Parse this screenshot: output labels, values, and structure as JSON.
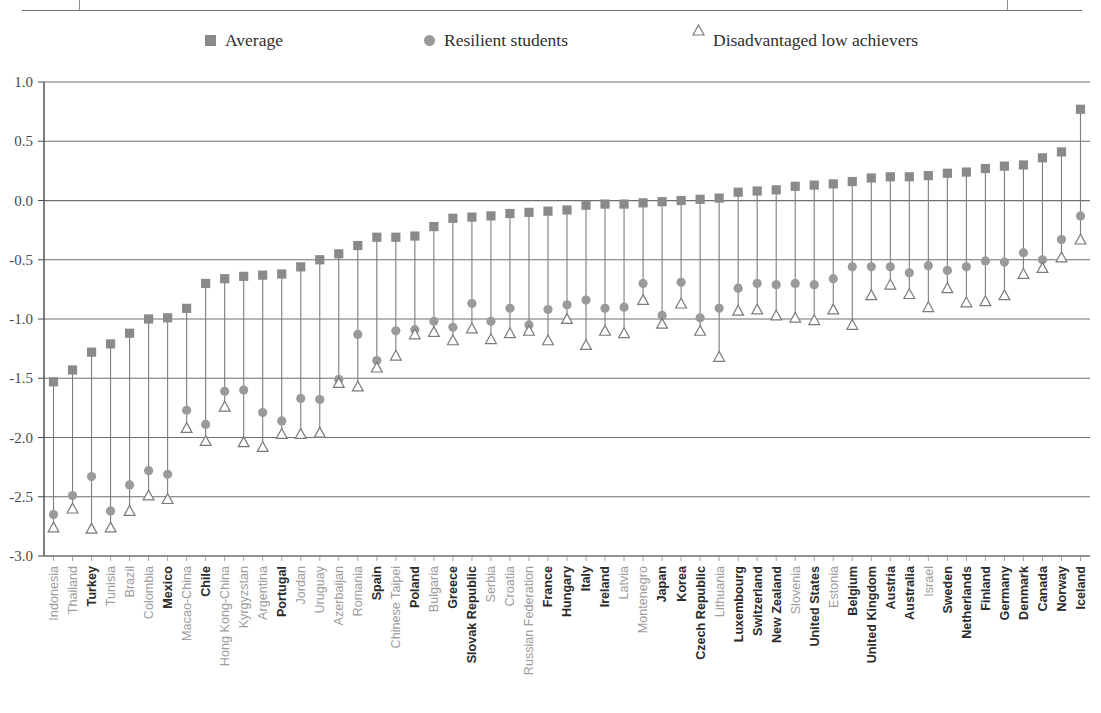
{
  "legend": {
    "items": [
      {
        "label": "Average",
        "marker": "square-marker-icon",
        "color": "#8a8a8a"
      },
      {
        "label": "Resilient students",
        "marker": "circle-marker-icon",
        "color": "#9a9a9a"
      },
      {
        "label": "Disadvantaged low achievers",
        "marker": "triangle-marker-icon",
        "color": "#7a7a7a"
      }
    ]
  },
  "colors": {
    "average": "#8a8a8a",
    "resilient": "#9a9a9a",
    "disadvantaged": "#7a7a7a",
    "gridline": "#6f6f6f",
    "axis": "#4a4a4a",
    "oecd_label": "#2b2b2b",
    "partner_label": "#9d9d9d"
  },
  "chart_data": {
    "type": "scatter",
    "title": "",
    "xlabel": "",
    "ylabel": "",
    "ylim": [
      -3.0,
      1.0
    ],
    "yticks": [
      1.0,
      0.5,
      0.0,
      -0.5,
      -1.0,
      -1.5,
      -2.0,
      -2.5,
      -3.0
    ],
    "ytick_labels": [
      "1.0",
      "0.5",
      "0.0",
      "-0.5",
      "-1.0",
      "-1.5",
      "-2.0",
      "-2.5",
      "-3.0"
    ],
    "grid": true,
    "legend_position": "top",
    "categories": [
      "Indonesia",
      "Thailand",
      "Turkey",
      "Tunisia",
      "Brazil",
      "Colombia",
      "Mexico",
      "Macao-China",
      "Chile",
      "Hong Kong-China",
      "Kyrgyzstan",
      "Argentina",
      "Portugal",
      "Jordan",
      "Uruguay",
      "Azerbaijan",
      "Romania",
      "Spain",
      "Chinese Taipei",
      "Poland",
      "Bulgaria",
      "Greece",
      "Slovak Republic",
      "Serbia",
      "Croatia",
      "Russian Federation",
      "France",
      "Hungary",
      "Italy",
      "Ireland",
      "Latvia",
      "Montenegro",
      "Japan",
      "Korea",
      "Czech Republic",
      "Lithuania",
      "Luxembourg",
      "Switzerland",
      "New Zealand",
      "Slovenia",
      "United States",
      "Estonia",
      "Belgium",
      "United Kingdom",
      "Austria",
      "Australia",
      "Israel",
      "Sweden",
      "Netherlands",
      "Finland",
      "Germany",
      "Denmark",
      "Canada",
      "Norway",
      "Iceland"
    ],
    "category_is_oecd": [
      false,
      false,
      true,
      false,
      false,
      false,
      true,
      false,
      true,
      false,
      false,
      false,
      true,
      false,
      false,
      false,
      false,
      true,
      false,
      true,
      false,
      true,
      true,
      false,
      false,
      false,
      true,
      true,
      true,
      true,
      false,
      false,
      true,
      true,
      true,
      false,
      true,
      true,
      true,
      false,
      true,
      false,
      true,
      true,
      true,
      true,
      false,
      true,
      true,
      true,
      true,
      true,
      true,
      true,
      true
    ],
    "series": [
      {
        "name": "Average",
        "marker": "square",
        "values": [
          -1.53,
          -1.43,
          -1.28,
          -1.21,
          -1.12,
          -1.0,
          -0.99,
          -0.91,
          -0.7,
          -0.66,
          -0.64,
          -0.63,
          -0.62,
          -0.56,
          -0.5,
          -0.45,
          -0.38,
          -0.31,
          -0.31,
          -0.3,
          -0.22,
          -0.15,
          -0.14,
          -0.13,
          -0.11,
          -0.1,
          -0.09,
          -0.08,
          -0.04,
          -0.03,
          -0.03,
          -0.02,
          -0.01,
          0.0,
          0.01,
          0.02,
          0.07,
          0.08,
          0.09,
          0.12,
          0.13,
          0.14,
          0.16,
          0.19,
          0.2,
          0.2,
          0.21,
          0.23,
          0.24,
          0.27,
          0.29,
          0.3,
          0.36,
          0.41,
          0.77
        ]
      },
      {
        "name": "Resilient students",
        "marker": "circle",
        "values": [
          -2.65,
          -2.49,
          -2.33,
          -2.62,
          -2.4,
          -2.28,
          -2.31,
          -1.77,
          -1.89,
          -1.61,
          -1.6,
          -1.79,
          -1.86,
          -1.67,
          -1.68,
          -1.51,
          -1.13,
          -1.35,
          -1.1,
          -1.09,
          -1.02,
          -1.07,
          -0.87,
          -1.02,
          -0.91,
          -1.05,
          -0.92,
          -0.88,
          -0.84,
          -0.91,
          -0.9,
          -0.7,
          -0.97,
          -0.69,
          -0.99,
          -0.91,
          -0.74,
          -0.7,
          -0.71,
          -0.7,
          -0.71,
          -0.66,
          -0.56,
          -0.56,
          -0.56,
          -0.61,
          -0.55,
          -0.59,
          -0.56,
          -0.51,
          -0.52,
          -0.44,
          -0.5,
          -0.33,
          -0.13
        ]
      },
      {
        "name": "Disadvantaged low achievers",
        "marker": "triangle",
        "values": [
          -2.76,
          -2.6,
          -2.77,
          -2.76,
          -2.62,
          -2.49,
          -2.52,
          -1.92,
          -2.03,
          -1.74,
          -2.04,
          -2.08,
          -1.97,
          -1.97,
          -1.96,
          -1.54,
          -1.57,
          -1.41,
          -1.31,
          -1.13,
          -1.11,
          -1.18,
          -1.08,
          -1.17,
          -1.12,
          -1.1,
          -1.18,
          -1.0,
          -1.22,
          -1.1,
          -1.12,
          -0.84,
          -1.04,
          -0.87,
          -1.1,
          -1.32,
          -0.93,
          -0.92,
          -0.97,
          -0.99,
          -1.01,
          -0.92,
          -1.05,
          -0.8,
          -0.71,
          -0.79,
          -0.9,
          -0.74,
          -0.86,
          -0.85,
          -0.8,
          -0.62,
          -0.57,
          -0.48,
          -0.33
        ]
      }
    ]
  }
}
